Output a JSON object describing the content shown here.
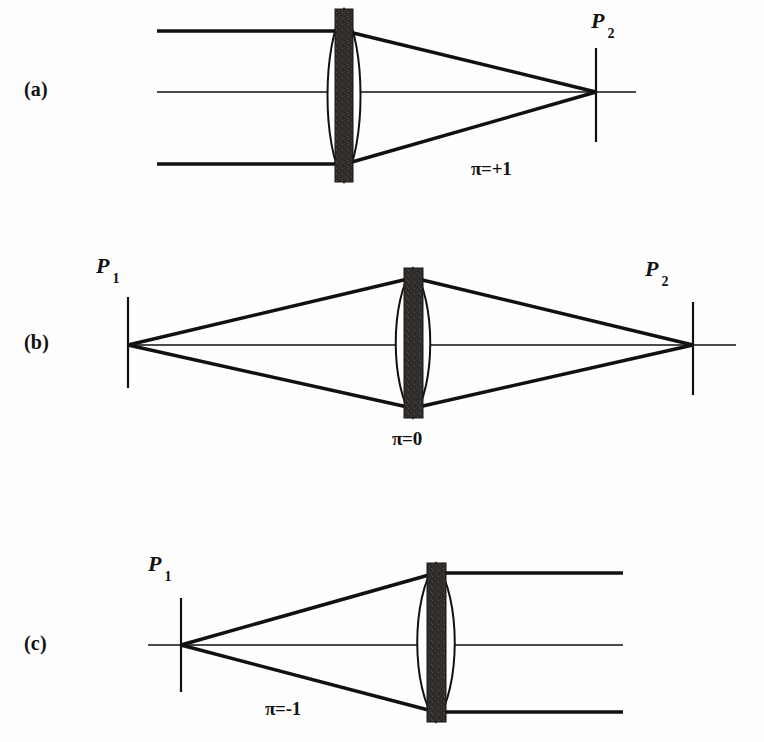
{
  "figure": {
    "background_color": "#fefefe",
    "ink_color": "#111111",
    "lens_fill_color": "#2f2b29",
    "lens_outline_color": "#111111"
  },
  "panels": [
    {
      "id": "a",
      "label": "(a)",
      "parity_label": "π=+1",
      "description": "Collimated input rays focused to point P2 on the right",
      "point_labels": [
        {
          "name": "P",
          "subscript": "2",
          "side": "right"
        }
      ]
    },
    {
      "id": "b",
      "label": "(b)",
      "parity_label": "π=0",
      "description": "Point P1 imaged to point P2 through the lens",
      "point_labels": [
        {
          "name": "P",
          "subscript": "1",
          "side": "left"
        },
        {
          "name": "P",
          "subscript": "2",
          "side": "right"
        }
      ]
    },
    {
      "id": "c",
      "label": "(c)",
      "parity_label": "π=-1",
      "description": "Point P1 collimated into parallel output rays",
      "point_labels": [
        {
          "name": "P",
          "subscript": "1",
          "side": "left"
        }
      ]
    }
  ],
  "geometry": {
    "panel_a": {
      "axis_y": 92,
      "lens_center_x": 344,
      "lens_top_y": 9,
      "lens_bottom_y": 182,
      "bar_left_x": 335,
      "bar_right_x": 353,
      "rays_start_x": 157,
      "ray_top_y": 31,
      "ray_bottom_y": 164,
      "focus_x": 596,
      "screen_top_y": 48,
      "screen_bottom_y": 142
    },
    "panel_b": {
      "axis_y": 345,
      "lens_center_x": 413,
      "lens_top_y": 268,
      "lens_bottom_y": 418,
      "bar_left_x": 404,
      "bar_right_x": 423,
      "left_focus_x": 128,
      "right_focus_x": 693,
      "left_screen_top_y": 297,
      "left_screen_bottom_y": 388,
      "right_screen_top_y": 302,
      "right_screen_bottom_y": 395,
      "ray_edge_top_y": 278,
      "ray_edge_bottom_y": 408
    },
    "panel_c": {
      "axis_y": 645,
      "lens_center_x": 436,
      "lens_top_y": 563,
      "lens_bottom_y": 722,
      "bar_left_x": 427,
      "bar_right_x": 446,
      "focus_x": 181,
      "screen_top_y": 598,
      "screen_bottom_y": 692,
      "rays_end_x": 623,
      "ray_top_y": 573,
      "ray_bottom_y": 712
    }
  }
}
